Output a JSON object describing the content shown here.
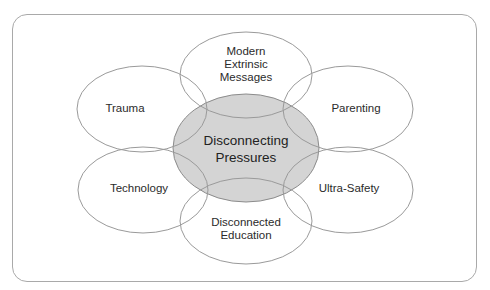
{
  "diagram": {
    "center": {
      "lines": [
        "Disconnecting",
        "Pressures"
      ],
      "fill": "#d4d4d4",
      "stroke": "#8c8c8c"
    },
    "petals": [
      {
        "id": "modern",
        "lines": [
          "Modern",
          "Extrinsic",
          "Messages"
        ]
      },
      {
        "id": "trauma",
        "lines": [
          "Trauma"
        ]
      },
      {
        "id": "parenting",
        "lines": [
          "Parenting"
        ]
      },
      {
        "id": "technology",
        "lines": [
          "Technology"
        ]
      },
      {
        "id": "ultra-safety",
        "lines": [
          "Ultra-Safety"
        ]
      },
      {
        "id": "education",
        "lines": [
          "Disconnected",
          "Education"
        ]
      }
    ],
    "petal_stroke": "#9a9a9a"
  }
}
